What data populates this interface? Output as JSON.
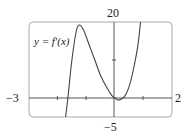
{
  "chart_data": {
    "type": "line",
    "title": "",
    "series": [
      {
        "name": "y = f'(x)",
        "x": [
          -1.72,
          -1.64,
          -1.5,
          -1.35,
          -1.25,
          -1.1,
          -0.9,
          -0.7,
          -0.5,
          -0.3,
          -0.1,
          0,
          0.1,
          0.2,
          0.35,
          0.5,
          0.65,
          0.8,
          0.9
        ],
        "y": [
          -5,
          0,
          10,
          17.5,
          19.2,
          18,
          14,
          10,
          6,
          3,
          0.6,
          0,
          -0.5,
          -0.4,
          0.5,
          3,
          7.5,
          13.5,
          20
        ]
      }
    ],
    "xlim": [
      -3,
      2
    ],
    "ylim": [
      -5,
      20
    ],
    "x_tick_labels": [
      "-3",
      "2"
    ],
    "y_tick_labels": [
      "20",
      "-5"
    ],
    "x_ticks": [
      -2,
      -1,
      1
    ],
    "y_ticks": [
      10
    ],
    "xlabel": "",
    "ylabel": "",
    "annotations": [
      "y = f'(x)"
    ],
    "grid": false
  },
  "labels": {
    "y_max": "20",
    "y_min": "−5",
    "x_min": "−3",
    "x_max": "2",
    "curve_label": "y = f′(x)"
  }
}
